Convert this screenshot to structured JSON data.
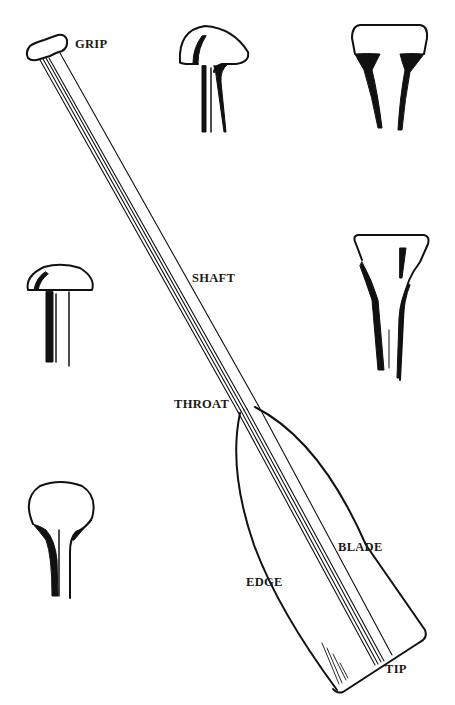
{
  "diagram": {
    "labels": {
      "grip": "GRIP",
      "shaft": "SHAFT",
      "throat": "THROAT",
      "blade": "BLADE",
      "edge": "EDGE",
      "tip": "TIP"
    },
    "grip_variants": [
      {
        "id": "pear-grip",
        "position": "top-center"
      },
      {
        "id": "flared-t-grip",
        "position": "top-right"
      },
      {
        "id": "mushroom-grip",
        "position": "middle-left"
      },
      {
        "id": "tapered-t-grip",
        "position": "middle-right"
      },
      {
        "id": "bulb-grip",
        "position": "bottom-left"
      }
    ],
    "colors": {
      "ink": "#111111",
      "background": "#ffffff"
    }
  }
}
